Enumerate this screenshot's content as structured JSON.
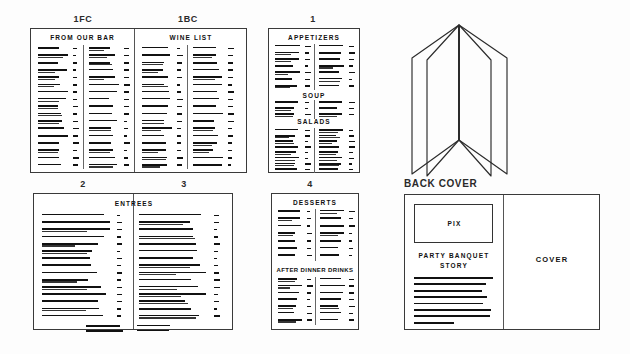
{
  "figure": {
    "background_color": "#fdfdfd",
    "ink_color": "#111111"
  },
  "panels": [
    {
      "id": "panel-1fc-1bc",
      "labels": [
        "1FC",
        "1BC"
      ],
      "sections": [
        {
          "heading": "FROM OUR BAR",
          "columns": 2,
          "rows_per_column": 17
        },
        {
          "heading": "WINE LIST",
          "columns": 2,
          "rows_per_column": 17
        }
      ]
    },
    {
      "id": "panel-1",
      "labels": [
        "1"
      ],
      "sections": [
        {
          "heading": "APPETIZERS",
          "columns": 2,
          "rows_per_column": 7
        },
        {
          "heading": "SOUP",
          "columns": 2,
          "rows_per_column": 3
        },
        {
          "heading": "SALADS",
          "columns": 2,
          "rows_per_column": 8
        }
      ]
    },
    {
      "id": "panel-2-3",
      "labels": [
        "2",
        "3"
      ],
      "sections": [
        {
          "heading": "ENTREES",
          "columns": 2,
          "rows_per_column": 16
        }
      ]
    },
    {
      "id": "panel-4",
      "labels": [
        "4"
      ],
      "sections": [
        {
          "heading": "DESSERTS",
          "columns": 2,
          "rows_per_column": 7
        },
        {
          "heading": "AFTER DINNER DRINKS",
          "columns": 2,
          "rows_per_column": 8
        }
      ]
    },
    {
      "id": "panel-cover",
      "labels": [
        "BACK COVER"
      ],
      "back_cover": {
        "pix_label": "PIX",
        "story_heading_line1": "PARTY BANQUET",
        "story_heading_line2": "STORY",
        "story_lines": 8
      },
      "front_cover": {
        "label": "COVER"
      }
    }
  ],
  "fold_illustration": {
    "name": "accordion-fold-menu",
    "panel_count": 4,
    "caption": "BACK COVER"
  },
  "labels": {
    "one_fc": "1FC",
    "one_bc": "1BC",
    "one": "1",
    "two": "2",
    "three": "3",
    "four": "4",
    "back_cover": "BACK COVER",
    "cover": "COVER",
    "pix": "PIX",
    "from_our_bar": "FROM OUR BAR",
    "wine_list": "WINE LIST",
    "appetizers": "APPETIZERS",
    "soup": "SOUP",
    "salads": "SALADS",
    "entrees": "ENTREES",
    "desserts": "DESSERTS",
    "after_dinner_drinks": "AFTER DINNER DRINKS",
    "party_banquet": "PARTY BANQUET",
    "story": "STORY"
  }
}
